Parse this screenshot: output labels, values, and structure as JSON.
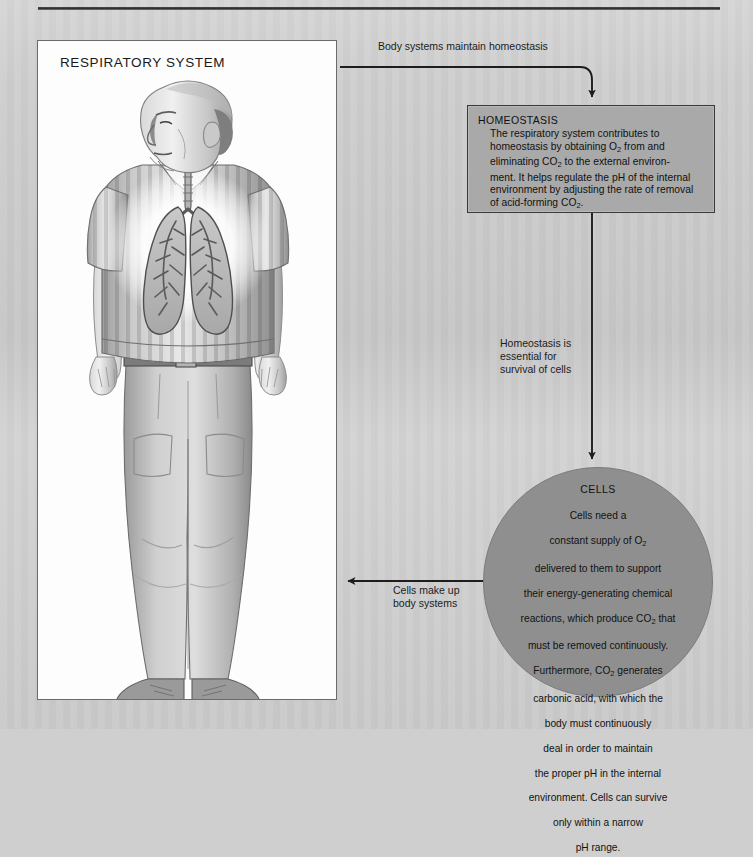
{
  "page": {
    "background_color": "#cdcdcd",
    "rule_color": "#333333"
  },
  "illustration": {
    "title": "RESPIRATORY SYSTEM",
    "panel_background": "#fdfdfd",
    "border_color": "#6b6b6b",
    "subject": "man-with-lungs-illustration"
  },
  "connectors": {
    "top_label": "Body systems maintain homeostasis",
    "middle_label": "Homeostasis is\nessential for\nsurvival of cells",
    "bottom_label": "Cells make up\nbody systems"
  },
  "homeostasis": {
    "title": "HOMEOSTASIS",
    "body_line1": "The respiratory system contributes to",
    "body_line2_a": "homeostasis by obtaining O",
    "body_line2_sub": "2",
    "body_line2_b": " from and",
    "body_line3_a": "eliminating CO",
    "body_line3_sub": "2",
    "body_line3_b": " to the external environ-",
    "body_line4": "ment. It helps regulate the pH of the internal",
    "body_line5": "environment by adjusting the rate of removal",
    "body_line6_a": "of acid-forming CO",
    "body_line6_sub": "2",
    "body_line6_b": ".",
    "fill_color": "#a9a9a9",
    "border_color": "#3a3a3a"
  },
  "cells": {
    "title": "CELLS",
    "line1": "Cells need a",
    "line2_a": "constant supply of O",
    "line2_sub": "2",
    "line3": "delivered to them to support",
    "line4": "their energy-generating chemical",
    "line5_a": "reactions, which produce CO",
    "line5_sub": "2",
    "line5_b": " that",
    "line6": "must be removed continuously.",
    "line7_a": "Furthermore, CO",
    "line7_sub": "2",
    "line7_b": " generates",
    "line8": "carbonic acid, with which the",
    "line9": "body must continuously",
    "line10": "deal in order to maintain",
    "line11": "the proper pH in the internal",
    "line12": "environment. Cells can survive",
    "line13": "only within a narrow",
    "line14": "pH range.",
    "fill_color": "#8f8f8f"
  }
}
